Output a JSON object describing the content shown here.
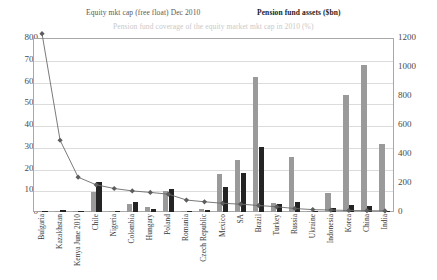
{
  "legend": {
    "equity": "Equity mkt cap (free float) Dec 2010",
    "pension": "Pension fund assets ($bn)",
    "coverage": "Pension fund coverage of the equity market mkt cap in 2010 (%)"
  },
  "axes": {
    "left_ticks": [
      "800",
      "700",
      "600",
      "500",
      "400",
      "300",
      "200",
      "100",
      "0"
    ],
    "right_ticks": [
      "1200",
      "1000",
      "800",
      "600",
      "400",
      "200",
      "0"
    ]
  },
  "chart_data": {
    "type": "bar",
    "title": "",
    "xlabel": "",
    "ylabel": "",
    "y2label": "",
    "ylim": [
      0,
      800
    ],
    "y2lim": [
      0,
      1200
    ],
    "grid": true,
    "legend_position": "top",
    "categories": [
      "Bulgaria",
      "Kazakhstan",
      "Kenya June 2010",
      "Chile",
      "Nigeria",
      "Colombia",
      "Hungary",
      "Poland",
      "Romania",
      "Czech Republic",
      "Mexico",
      "SA",
      "Brazil",
      "Turkey",
      "Russia",
      "Ukraine",
      "Indonesia",
      "Korea",
      "China",
      "India"
    ],
    "series": [
      {
        "name": "Equity mkt cap (free float) Dec 2010",
        "type": "bar",
        "axis": "right",
        "color": "#9a9a9a",
        "values": [
          2,
          4,
          6,
          135,
          10,
          55,
          32,
          145,
          8,
          22,
          262,
          360,
          930,
          62,
          382,
          8,
          128,
          810,
          1012,
          472
        ]
      },
      {
        "name": "Pension fund assets ($bn)",
        "type": "bar",
        "axis": "right",
        "color": "#242424",
        "values": [
          1,
          13,
          2,
          208,
          9,
          72,
          20,
          158,
          2,
          14,
          172,
          270,
          450,
          52,
          68,
          2,
          27,
          48,
          42,
          10
        ]
      },
      {
        "name": "Pension fund coverage of the equity market mkt cap in 2010 (%)",
        "type": "line",
        "axis": "left",
        "color": "#6b6b6b",
        "values": [
          820,
          330,
          160,
          125,
          108,
          97,
          90,
          82,
          55,
          47,
          40,
          36,
          30,
          24,
          16,
          11,
          9,
          7,
          6,
          5
        ]
      }
    ]
  }
}
